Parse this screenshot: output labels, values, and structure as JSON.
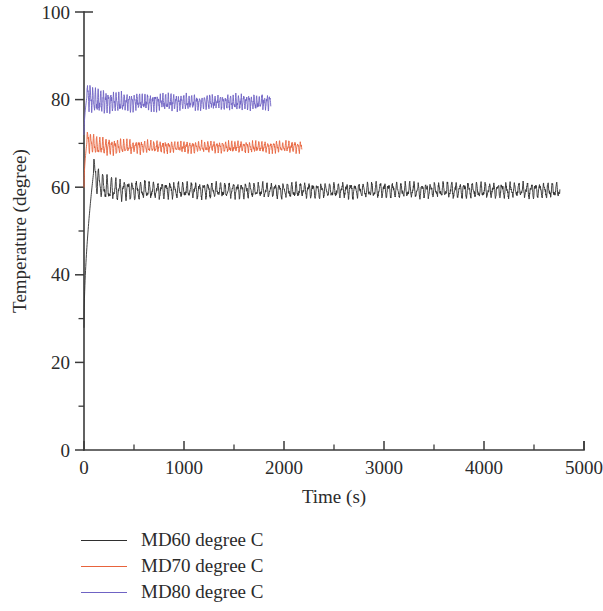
{
  "chart_data": {
    "type": "line",
    "title": "",
    "xlabel": "Time (s)",
    "ylabel": "Temperature (degree)",
    "xlim": [
      0,
      5000
    ],
    "ylim": [
      0,
      100
    ],
    "x_ticks": [
      0,
      1000,
      2000,
      3000,
      4000,
      5000
    ],
    "x_tick_labels": [
      "0",
      "1000",
      "2000",
      "3000",
      "4000",
      "5000"
    ],
    "x_minor_ticks": [
      500,
      1500,
      2500,
      3500,
      4500
    ],
    "y_ticks": [
      0,
      20,
      40,
      60,
      80,
      100
    ],
    "y_tick_labels": [
      "0",
      "20",
      "40",
      "60",
      "80",
      "100"
    ],
    "y_minor_ticks": [
      10,
      30,
      50,
      70,
      90
    ],
    "grid": false,
    "legend_position": "below-left",
    "series": [
      {
        "name": "MD60 degree C",
        "color": "#2f2f2f",
        "x_start": 0,
        "x_end": 4760,
        "mean": 59.3,
        "amplitude": 1.7,
        "ramp_from": 28.0,
        "ramp_peak": 63.2,
        "ramp_end_x": 95,
        "noise": 0.45,
        "period": 42,
        "notes": "Starts near 28 at t=0, rises sharply to ~63, then oscillates about 59 with amplitude ~1.7 through t=4760"
      },
      {
        "name": "MD70 degree C",
        "color": "#e8633c",
        "x_start": 0,
        "x_end": 2180,
        "mean": 69.2,
        "amplitude": 1.2,
        "ramp_from": 60.0,
        "ramp_peak": 70.4,
        "ramp_end_x": 30,
        "noise": 0.38,
        "period": 30,
        "notes": "Flat oscillating band centred near 69 spanning t=0 to t=2180"
      },
      {
        "name": "MD80 degree C",
        "color": "#6f63c4",
        "x_start": 0,
        "x_end": 1870,
        "mean": 79.4,
        "amplitude": 1.6,
        "ramp_from": 72.0,
        "ramp_peak": 80.8,
        "ramp_end_x": 30,
        "noise": 0.55,
        "period": 26,
        "notes": "Flat oscillating band centred near 79.4 spanning t=0 to t=1870"
      }
    ]
  },
  "legend": {
    "items": [
      {
        "label": "MD60 degree C",
        "color": "#2f2f2f"
      },
      {
        "label": "MD70 degree C",
        "color": "#e8633c"
      },
      {
        "label": "MD80 degree C",
        "color": "#6f63c4"
      }
    ]
  },
  "axes": {
    "x_title": "Time (s)",
    "y_title": "Temperature (degree)"
  }
}
